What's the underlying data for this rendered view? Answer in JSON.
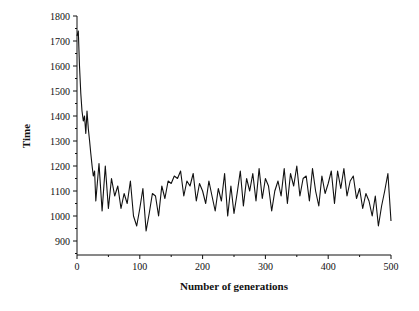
{
  "chart_data": {
    "type": "line",
    "title": "",
    "xlabel": "Number of generations",
    "ylabel": "Time",
    "xlim": [
      0,
      500
    ],
    "ylim": [
      845,
      1800
    ],
    "x_ticks": [
      0,
      100,
      200,
      300,
      400,
      500
    ],
    "y_ticks": [
      900,
      1000,
      1100,
      1200,
      1300,
      1400,
      1500,
      1600,
      1700,
      1800
    ],
    "grid": false,
    "legend": null,
    "series": [
      {
        "name": "Time",
        "color": "#111111",
        "x": [
          0,
          2,
          4,
          6,
          8,
          10,
          12,
          14,
          16,
          18,
          20,
          22,
          24,
          26,
          28,
          30,
          35,
          40,
          45,
          50,
          55,
          60,
          65,
          70,
          75,
          80,
          85,
          90,
          95,
          100,
          105,
          110,
          115,
          120,
          125,
          130,
          135,
          140,
          145,
          150,
          155,
          160,
          165,
          170,
          175,
          180,
          185,
          190,
          195,
          200,
          205,
          210,
          215,
          220,
          225,
          230,
          235,
          240,
          245,
          250,
          255,
          260,
          265,
          270,
          275,
          280,
          285,
          290,
          295,
          300,
          305,
          310,
          315,
          320,
          325,
          330,
          335,
          340,
          345,
          350,
          355,
          360,
          365,
          370,
          375,
          380,
          385,
          390,
          395,
          400,
          405,
          410,
          415,
          420,
          425,
          430,
          435,
          440,
          445,
          450,
          455,
          460,
          465,
          470,
          475,
          480,
          485,
          490,
          495,
          500
        ],
        "values": [
          1720,
          1740,
          1600,
          1490,
          1420,
          1380,
          1400,
          1330,
          1420,
          1350,
          1300,
          1250,
          1200,
          1160,
          1180,
          1060,
          1210,
          1020,
          1200,
          1030,
          1150,
          1080,
          1120,
          1030,
          1090,
          1050,
          1140,
          1000,
          960,
          1030,
          1110,
          940,
          1010,
          1090,
          1080,
          1000,
          1120,
          1070,
          1140,
          1130,
          1160,
          1150,
          1180,
          1080,
          1140,
          1120,
          1170,
          1060,
          1130,
          1100,
          1050,
          1140,
          1080,
          1020,
          1110,
          1060,
          1170,
          1000,
          1120,
          1010,
          1090,
          1180,
          1040,
          1150,
          1100,
          1170,
          1060,
          1190,
          1070,
          1150,
          1120,
          1020,
          1100,
          1140,
          1080,
          1190,
          1050,
          1170,
          1120,
          1200,
          1080,
          1150,
          1160,
          1060,
          1190,
          1100,
          1040,
          1160,
          1090,
          1130,
          1180,
          1050,
          1180,
          1110,
          1190,
          1080,
          1140,
          1160,
          1070,
          1110,
          1030,
          1090,
          1060,
          1000,
          1080,
          960,
          1040,
          1100,
          1170,
          980
        ]
      }
    ]
  }
}
